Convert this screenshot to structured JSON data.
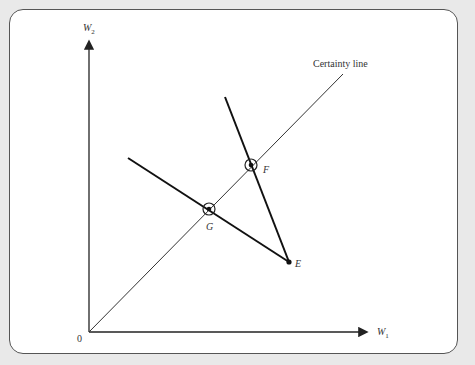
{
  "figure": {
    "y_axis_label": "W",
    "y_axis_sub": "2",
    "x_axis_label": "W",
    "x_axis_sub": "1",
    "origin_label": "0",
    "certainty_line_label": "Certainty line",
    "points": {
      "E": "E",
      "F": "F",
      "G": "G"
    }
  }
}
